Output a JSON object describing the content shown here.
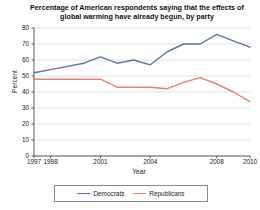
{
  "chart_data": {
    "type": "line",
    "title": "Percentage of American respondents saying that the effects of global warming have already begun, by party",
    "xlabel": "Year",
    "ylabel": "Percent",
    "xlim": [
      1997,
      2010
    ],
    "ylim": [
      0,
      80
    ],
    "grid": true,
    "legend_position": "bottom",
    "x": [
      1997,
      1998,
      1999,
      2000,
      2001,
      2002,
      2003,
      2004,
      2005,
      2006,
      2007,
      2008,
      2009,
      2010
    ],
    "xticks": [
      "1997",
      "1998",
      "2001",
      "2004",
      "2008",
      "2010"
    ],
    "xtick_values": [
      1997,
      1998,
      2001,
      2004,
      2008,
      2010
    ],
    "yticks": [
      "0",
      "10",
      "20",
      "30",
      "40",
      "50",
      "60",
      "70",
      "80"
    ],
    "ytick_values": [
      0,
      10,
      20,
      30,
      40,
      50,
      60,
      70,
      80
    ],
    "series": [
      {
        "name": "Democrats",
        "color": "#5c72ab",
        "values": [
          52,
          54,
          56,
          58,
          62,
          58,
          60,
          57,
          65,
          70,
          70,
          76,
          72,
          68
        ]
      },
      {
        "name": "Republicans",
        "color": "#e8806c",
        "values": [
          48,
          48,
          48,
          48,
          48,
          43,
          43,
          43,
          42,
          46,
          49,
          45,
          40,
          34
        ]
      }
    ]
  },
  "legend": {
    "items": [
      {
        "label": "Democrats",
        "color": "#5c72ab"
      },
      {
        "label": "Republicans",
        "color": "#e8806c"
      }
    ]
  }
}
